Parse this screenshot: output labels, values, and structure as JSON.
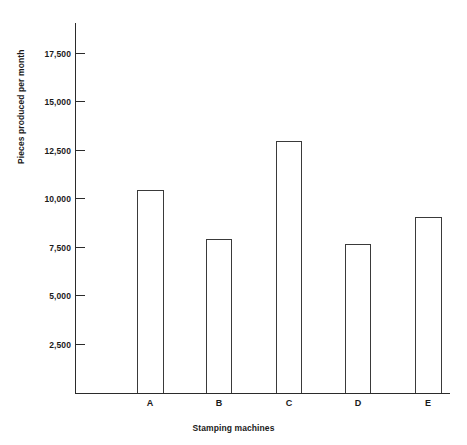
{
  "chart_data": {
    "type": "bar",
    "title": "",
    "xlabel": "Stamping machines",
    "ylabel": "Pieces produced per month",
    "categories": [
      "A",
      "B",
      "C",
      "D",
      "E"
    ],
    "values": [
      10400,
      7900,
      12900,
      7650,
      9000
    ],
    "ylim": [
      0,
      18500
    ],
    "ytick_values": [
      2500,
      5000,
      7500,
      10000,
      12500,
      15000,
      17500
    ],
    "ytick_labels": [
      "2,500",
      "5,000",
      "7,500",
      "10,000",
      "12,500",
      "15,000",
      "17,500"
    ],
    "grid": false,
    "legend": null,
    "bar_fill": "#ffffff",
    "bar_outline": "#3a3a3a",
    "axis_color": "#2b2b2b",
    "background": "#ffffff"
  }
}
